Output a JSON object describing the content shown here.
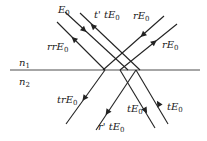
{
  "media": {
    "upper": "n",
    "upper_sub": "1",
    "lower": "n",
    "lower_sub": "2"
  },
  "labels": {
    "E0": {
      "main": "E",
      "sub": "0"
    },
    "tpt": {
      "main": "t' tE",
      "sub": "0"
    },
    "rE_top": {
      "main": "rE",
      "sub": "0"
    },
    "rrE": {
      "main": "rrE",
      "sub": "0"
    },
    "rE_right": {
      "main": "rE",
      "sub": "0"
    },
    "trE": {
      "main": "trE",
      "sub": "0"
    },
    "tE_mid": {
      "main": "tE",
      "sub": "0"
    },
    "tE_right": {
      "main": "tE",
      "sub": "0"
    },
    "rpt": {
      "main": "r' tE",
      "sub": "0"
    }
  },
  "colors": {
    "line": "#222222",
    "interface": "#888888"
  }
}
